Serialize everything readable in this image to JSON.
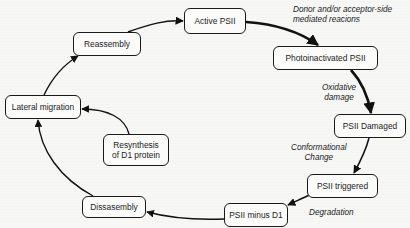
{
  "diagram": {
    "type": "cycle",
    "nodes": [
      {
        "id": "active",
        "label": "Active PSII"
      },
      {
        "id": "photoinactivated",
        "label": "Photoinactivated PSII"
      },
      {
        "id": "damaged",
        "label": "PSII Damaged"
      },
      {
        "id": "triggered",
        "label": "PSII triggered"
      },
      {
        "id": "minus_d1",
        "label": "PSII minus D1"
      },
      {
        "id": "disassembly",
        "label": "Dissasembly"
      },
      {
        "id": "resynthesis",
        "label_line1": "Resynthesis",
        "label_line2": "of D1 protein"
      },
      {
        "id": "lateral",
        "label": "Lateral migration"
      },
      {
        "id": "reassembly",
        "label": "Reassembly"
      }
    ],
    "edge_labels": {
      "donor_line1": "Donor and/or acceptor-side",
      "donor_line2": "mediated reacions",
      "oxidative_line1": "Oxidative",
      "oxidative_line2": "damage",
      "conformational_line1": "Conformational",
      "conformational_line2": "Change",
      "degradation": "Degradation"
    },
    "edges": [
      {
        "from": "active",
        "to": "photoinactivated",
        "label": "Donor and/or acceptor-side mediated reacions",
        "weight": "thick"
      },
      {
        "from": "photoinactivated",
        "to": "damaged",
        "label": "Oxidative damage",
        "weight": "thick"
      },
      {
        "from": "damaged",
        "to": "triggered",
        "label": "Conformational Change"
      },
      {
        "from": "triggered",
        "to": "minus_d1",
        "label": "Degradation"
      },
      {
        "from": "minus_d1",
        "to": "disassembly"
      },
      {
        "from": "disassembly",
        "to": "lateral"
      },
      {
        "from": "resynthesis",
        "to": "lateral"
      },
      {
        "from": "lateral",
        "to": "reassembly"
      },
      {
        "from": "reassembly",
        "to": "active"
      }
    ]
  }
}
